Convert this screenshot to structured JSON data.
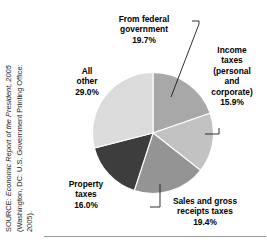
{
  "chart_data": {
    "type": "pie",
    "title": "",
    "subtitle": "",
    "xlabel": "",
    "ylabel": "",
    "legend_position": "callout-labels",
    "grid": false,
    "units": "percent",
    "total": 100.0,
    "categories": [
      "From federal government",
      "Income taxes (personal and corporate)",
      "Sales and gross receipts taxes",
      "Property taxes",
      "All other"
    ],
    "values": [
      19.7,
      15.9,
      19.4,
      16.0,
      29.0
    ],
    "slices": [
      {
        "name": "From federal government",
        "label_lines": [
          "From federal",
          "government"
        ],
        "value": 19.7,
        "value_text": "19.7%",
        "color": "#a8a8a8",
        "start_angle_deg": 0,
        "sweep_deg": 70.92
      },
      {
        "name": "Income taxes (personal and corporate)",
        "label_lines": [
          "Income",
          "taxes",
          "(personal",
          "and",
          "corporate)"
        ],
        "value": 15.9,
        "value_text": "15.9%",
        "color": "#c2c2c2",
        "start_angle_deg": 70.92,
        "sweep_deg": 57.24
      },
      {
        "name": "Sales and gross receipts taxes",
        "label_lines": [
          "Sales and gross",
          "receipts taxes"
        ],
        "value": 19.4,
        "value_text": "19.4%",
        "color": "#949494",
        "start_angle_deg": 128.16,
        "sweep_deg": 69.84
      },
      {
        "name": "Property taxes",
        "label_lines": [
          "Property",
          "taxes"
        ],
        "value": 16.0,
        "value_text": "16.0%",
        "color": "#3d3d3d",
        "start_angle_deg": 198.0,
        "sweep_deg": 57.6
      },
      {
        "name": "All other",
        "label_lines": [
          "All",
          "other"
        ],
        "value": 29.0,
        "value_text": "29.0%",
        "color": "#dcdcdc",
        "start_angle_deg": 255.6,
        "sweep_deg": 104.4
      }
    ]
  },
  "labels": {
    "federal": {
      "line1": "From federal",
      "line2": "government",
      "value": "19.7%"
    },
    "income": {
      "line1": "Income",
      "line2": "taxes",
      "line3": "(personal",
      "line4": "and",
      "line5": "corporate)",
      "value": "15.9%"
    },
    "all_other": {
      "line1": "All",
      "line2": "other",
      "value": "29.0%"
    },
    "property": {
      "line1": "Property",
      "line2": "taxes",
      "value": "16.0%"
    },
    "sales": {
      "line1": "Sales and gross",
      "line2": "receipts taxes",
      "value": "19.4%"
    }
  },
  "source": {
    "line1_prefix": "SOURCE: ",
    "line1_italic": "Economic Report of the President, 2005",
    "line2": "(Washington, DC: U.S. Government Printing Office:",
    "line3": "2005)."
  },
  "colors": {
    "background": "#ffffff",
    "text": "#000000",
    "leader_line": "#1a1a1a",
    "rule": "#9a9a9a",
    "slice_border": "#ffffff"
  }
}
